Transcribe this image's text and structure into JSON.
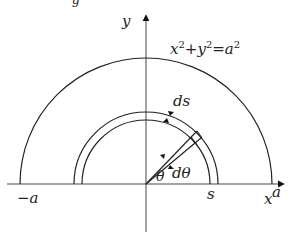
{
  "diagram": {
    "title_fragment": "g",
    "labels": {
      "y_axis": "y",
      "x_axis": "x",
      "equation_x": "x",
      "equation_y": "y",
      "equation_a": "a",
      "equation_plus": "+",
      "equation_eq": "=",
      "equation_exp": "2",
      "neg_a": "−a",
      "pos_a": "a",
      "s": "s",
      "ds": "ds",
      "theta": "θ",
      "dtheta": "dθ"
    },
    "geometry": {
      "origin": [
        146,
        184
      ],
      "outer_radius": 126,
      "inner_radius_1": 64,
      "inner_radius_2": 72,
      "strip_angle_deg": 50,
      "strip_dtheta_deg": 6
    },
    "colors": {
      "stroke": "#222222",
      "background": "#ffffff"
    }
  }
}
